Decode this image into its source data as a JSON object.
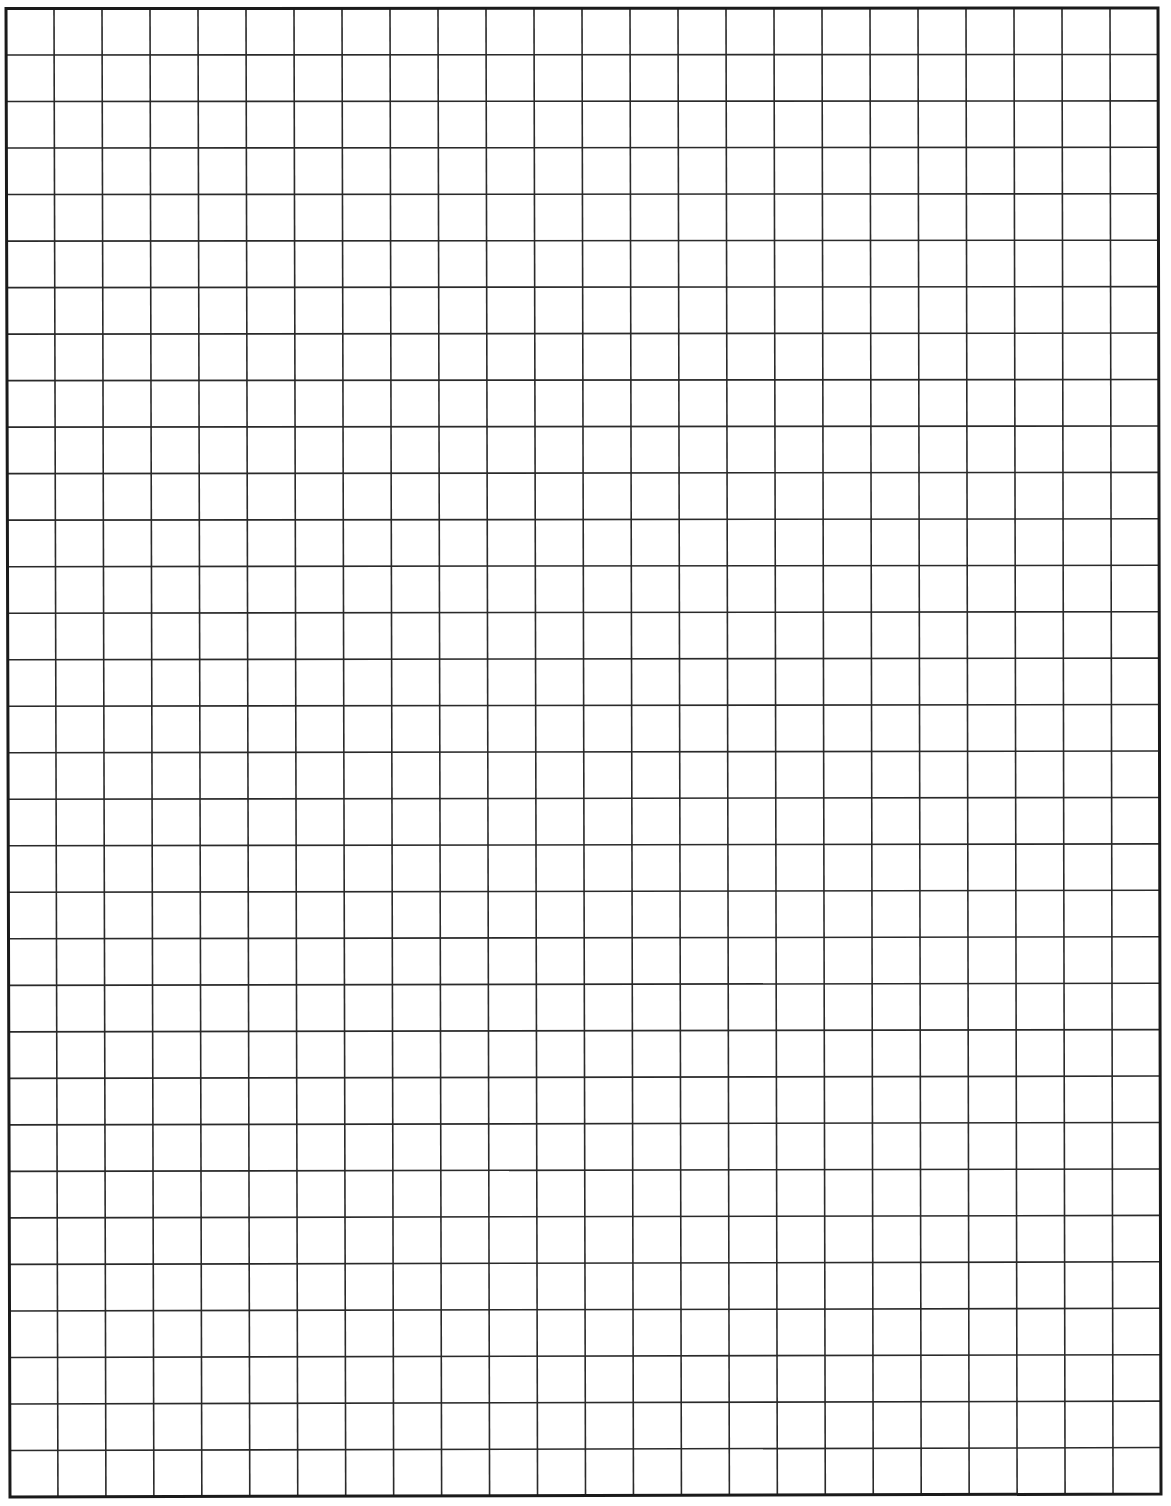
{
  "page": {
    "type": "graph-paper-sheet",
    "background_color": "#ffffff"
  },
  "grid": {
    "columns": 24,
    "rows": 32,
    "line_color": "#2a2a2a",
    "border_color": "#1a1a1a",
    "inner_line_width": 1.6,
    "border_line_width": 3,
    "top_left": [
      6,
      8.5
    ],
    "top_right": [
      1158,
      8
    ],
    "bottom_left": [
      10,
      1497
    ],
    "bottom_right": [
      1161,
      1494
    ]
  }
}
